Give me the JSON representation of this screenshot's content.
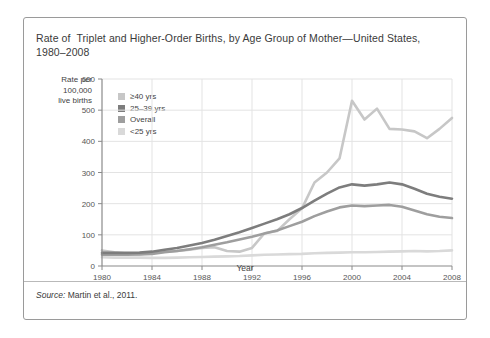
{
  "figure": {
    "title": "Rate of  Triplet and Higher-Order Births, by Age Group of Mother—United States, 1980–2008",
    "source_label": "Source:",
    "source_text": " Martin et al., 2011.",
    "y_axis_caption": "Rate per\n100,000\nlive births"
  },
  "colors": {
    "ge40": "#c7c7c7",
    "age25_39": "#7d7d7d",
    "overall": "#9e9e9e",
    "lt25": "#d9d9d9",
    "axis": "#8a8a8a",
    "grid": "#e3e3e3",
    "frame": "#9a9a9a",
    "text": "#3a3a3a"
  },
  "legend": {
    "items": [
      {
        "label": "≥40 yrs",
        "color": "#c7c7c7"
      },
      {
        "label": "25–39 yrs",
        "color": "#7d7d7d"
      },
      {
        "label": "Overall",
        "color": "#9e9e9e"
      },
      {
        "label": "<25 yrs",
        "color": "#d9d9d9"
      }
    ]
  },
  "chart_data": {
    "type": "line",
    "title": "Rate of  Triplet and Higher-Order Births, by Age Group of Mother—United States, 1980–2008",
    "xlabel": "Year",
    "ylabel": "Rate per 100,000 live births",
    "xlim": [
      1980,
      2008
    ],
    "ylim": [
      0,
      600
    ],
    "yticks": [
      0,
      100,
      200,
      300,
      400,
      500,
      600
    ],
    "xticks": [
      1980,
      1984,
      1988,
      1992,
      1996,
      2000,
      2004,
      2008
    ],
    "grid": true,
    "legend_position": "upper-left-inside",
    "x": [
      1980,
      1981,
      1982,
      1983,
      1984,
      1985,
      1986,
      1987,
      1988,
      1989,
      1990,
      1991,
      1992,
      1993,
      1994,
      1995,
      1996,
      1997,
      1998,
      1999,
      2000,
      2001,
      2002,
      2003,
      2004,
      2005,
      2006,
      2007,
      2008
    ],
    "series": [
      {
        "name": "≥40 yrs",
        "color": "#c7c7c7",
        "values": [
          50,
          44,
          40,
          38,
          42,
          46,
          48,
          52,
          58,
          60,
          48,
          46,
          58,
          105,
          112,
          150,
          185,
          268,
          300,
          345,
          530,
          470,
          505,
          440,
          438,
          432,
          410,
          440,
          475
        ]
      },
      {
        "name": "25–39 yrs",
        "color": "#7d7d7d",
        "values": [
          42,
          42,
          42,
          43,
          46,
          52,
          58,
          66,
          74,
          84,
          96,
          108,
          122,
          136,
          150,
          166,
          186,
          210,
          232,
          252,
          262,
          258,
          262,
          268,
          262,
          248,
          232,
          222,
          216
        ]
      },
      {
        "name": "Overall",
        "color": "#9e9e9e",
        "values": [
          36,
          36,
          36,
          37,
          39,
          44,
          48,
          54,
          60,
          68,
          76,
          85,
          94,
          104,
          114,
          128,
          142,
          160,
          175,
          188,
          194,
          192,
          194,
          196,
          190,
          178,
          166,
          158,
          154
        ]
      },
      {
        "name": "<25 yrs",
        "color": "#d9d9d9",
        "values": [
          28,
          27,
          27,
          27,
          26,
          26,
          27,
          28,
          29,
          30,
          31,
          32,
          34,
          36,
          37,
          38,
          39,
          41,
          42,
          43,
          44,
          44,
          45,
          46,
          47,
          48,
          47,
          48,
          50
        ]
      }
    ]
  }
}
